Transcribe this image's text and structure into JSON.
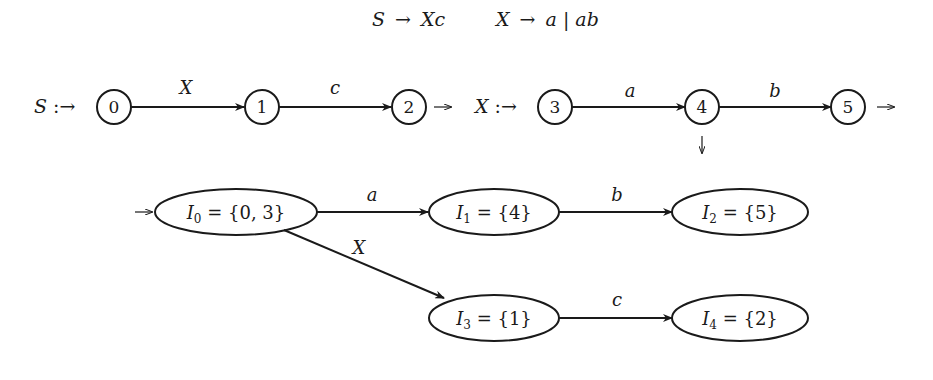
{
  "grammar": {
    "rule1": {
      "lhs": "S",
      "arrow": "→",
      "rhs": "Xc"
    },
    "rule2": {
      "lhs": "X",
      "arrow": "→",
      "rhs": "a | ab"
    }
  },
  "nfa_S": {
    "label": "S :→",
    "states": [
      {
        "id": "0",
        "label": "0"
      },
      {
        "id": "1",
        "label": "1"
      },
      {
        "id": "2",
        "label": "2"
      }
    ],
    "transitions": [
      {
        "from": "0",
        "to": "1",
        "symbol": "X"
      },
      {
        "from": "1",
        "to": "2",
        "symbol": "c"
      }
    ],
    "final_arrow": "→"
  },
  "nfa_X": {
    "label": "X :→",
    "states": [
      {
        "id": "3",
        "label": "3"
      },
      {
        "id": "4",
        "label": "4"
      },
      {
        "id": "5",
        "label": "5"
      }
    ],
    "transitions": [
      {
        "from": "3",
        "to": "4",
        "symbol": "a"
      },
      {
        "from": "4",
        "to": "5",
        "symbol": "b"
      }
    ],
    "final_arrows": {
      "after_4": "↓",
      "after_5": "→"
    }
  },
  "dfa": {
    "start_arrow": "→",
    "states": [
      {
        "id": "I0",
        "name": "I",
        "sub": "0",
        "set": " = {0, 3}"
      },
      {
        "id": "I1",
        "name": "I",
        "sub": "1",
        "set": " = {4}"
      },
      {
        "id": "I2",
        "name": "I",
        "sub": "2",
        "set": " = {5}"
      },
      {
        "id": "I3",
        "name": "I",
        "sub": "3",
        "set": " = {1}"
      },
      {
        "id": "I4",
        "name": "I",
        "sub": "4",
        "set": " = {2}"
      }
    ],
    "transitions": [
      {
        "from": "I0",
        "to": "I1",
        "symbol": "a"
      },
      {
        "from": "I1",
        "to": "I2",
        "symbol": "b"
      },
      {
        "from": "I0",
        "to": "I3",
        "symbol": "X"
      },
      {
        "from": "I3",
        "to": "I4",
        "symbol": "c"
      }
    ]
  }
}
